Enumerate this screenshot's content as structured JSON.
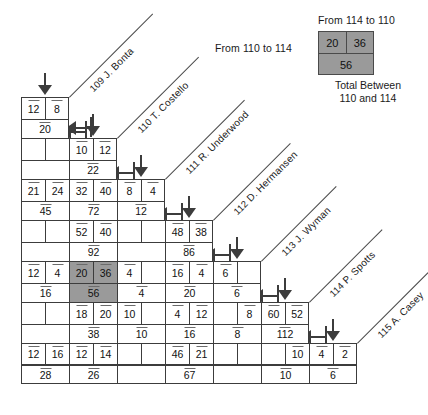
{
  "legend": {
    "top_label": "From 114 to 110",
    "left_label": "From 110 to 114",
    "bottom_label": "Total Between 110 and 114",
    "cell_from_a_to_b": "20",
    "cell_from_b_to_a": "36",
    "cell_total": "56",
    "highlight_color": "#9a9a9a"
  },
  "departments": [
    {
      "number": "109",
      "name": "J. Bonta"
    },
    {
      "number": "110",
      "name": "T. Costello"
    },
    {
      "number": "111",
      "name": "R. Underwood"
    },
    {
      "number": "112",
      "name": "D. Hermansen"
    },
    {
      "number": "113",
      "name": "J. Wyman"
    },
    {
      "number": "114",
      "name": "P. Spotts"
    },
    {
      "number": "115",
      "name": "A. Casey"
    }
  ],
  "chart_data": {
    "type": "table",
    "row_labels": [
      "109 J. Bonta",
      "110 T. Costello",
      "111 R. Underwood",
      "112 D. Hermansen",
      "113 J. Wyman",
      "114 P. Spotts",
      "115 A. Casey"
    ],
    "col_labels": [
      "109 J. Bonta",
      "110 T. Costello",
      "111 R. Underwood",
      "112 D. Hermansen",
      "113 J. Wyman",
      "114 P. Spotts",
      "115 A. Casey"
    ],
    "bands": [
      {
        "index": 0,
        "width": 2,
        "pairs": [
          {
            "a": "12",
            "b": "8",
            "total": "20",
            "highlight": false
          }
        ]
      },
      {
        "index": 1,
        "width": 4,
        "pairs": [
          {
            "a": "",
            "b": "",
            "total": "",
            "highlight": false
          },
          {
            "a": "10",
            "b": "12",
            "total": "22",
            "highlight": false
          }
        ]
      },
      {
        "index": 2,
        "width": 6,
        "pairs": [
          {
            "a": "21",
            "b": "24",
            "total": "45",
            "highlight": false
          },
          {
            "a": "32",
            "b": "40",
            "total": "72",
            "highlight": false
          },
          {
            "a": "8",
            "b": "4",
            "total": "12",
            "highlight": false
          }
        ]
      },
      {
        "index": 3,
        "width": 8,
        "pairs": [
          {
            "a": "",
            "b": "",
            "total": "",
            "highlight": false
          },
          {
            "a": "52",
            "b": "40",
            "total": "92",
            "highlight": false
          },
          {
            "a": "",
            "b": "",
            "total": "",
            "highlight": false
          },
          {
            "a": "48",
            "b": "38",
            "total": "86",
            "highlight": false
          }
        ]
      },
      {
        "index": 4,
        "width": 10,
        "pairs": [
          {
            "a": "12",
            "b": "4",
            "total": "16",
            "highlight": false
          },
          {
            "a": "20",
            "b": "36",
            "total": "56",
            "highlight": true
          },
          {
            "a": "4",
            "b": "",
            "total": "4",
            "highlight": false
          },
          {
            "a": "16",
            "b": "4",
            "total": "20",
            "highlight": false
          },
          {
            "a": "6",
            "b": "",
            "total": "6",
            "highlight": false
          }
        ]
      },
      {
        "index": 5,
        "width": 12,
        "pairs": [
          {
            "a": "",
            "b": "",
            "total": "",
            "highlight": false
          },
          {
            "a": "18",
            "b": "20",
            "total": "38",
            "highlight": false
          },
          {
            "a": "10",
            "b": "",
            "total": "10",
            "highlight": false
          },
          {
            "a": "4",
            "b": "12",
            "total": "16",
            "highlight": false
          },
          {
            "a": "",
            "b": "8",
            "total": "8",
            "highlight": false
          },
          {
            "a": "60",
            "b": "52",
            "total": "112",
            "highlight": false
          }
        ]
      },
      {
        "index": 6,
        "width": 14,
        "pairs": [
          {
            "a": "12",
            "b": "16",
            "total": "28",
            "highlight": false
          },
          {
            "a": "12",
            "b": "14",
            "total": "26",
            "highlight": false
          },
          {
            "a": "",
            "b": "",
            "total": "",
            "highlight": false
          },
          {
            "a": "46",
            "b": "21",
            "total": "67",
            "highlight": false
          },
          {
            "a": "",
            "b": "",
            "total": "",
            "highlight": false
          },
          {
            "a": "",
            "b": "10",
            "total": "10",
            "highlight": false
          },
          {
            "a": "4",
            "b": "2",
            "total": "6",
            "highlight": false
          }
        ]
      }
    ]
  }
}
